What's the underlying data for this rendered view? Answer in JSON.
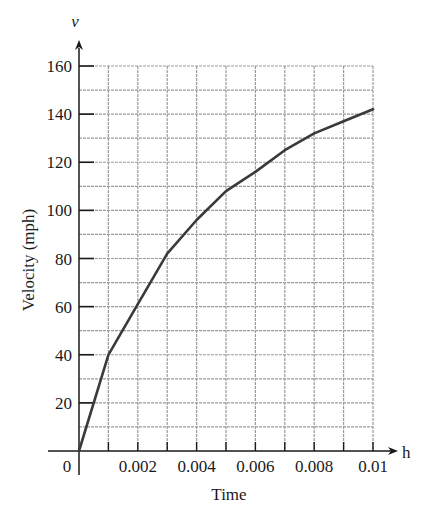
{
  "chart_data": {
    "type": "line",
    "title": "",
    "xlabel": "Time",
    "ylabel": "Velocity (mph)",
    "x_axis_variable": "h",
    "y_axis_variable": "v",
    "x": [
      0,
      0.001,
      0.002,
      0.003,
      0.004,
      0.005,
      0.006,
      0.007,
      0.008,
      0.009,
      0.01
    ],
    "series": [
      {
        "name": "Velocity",
        "values": [
          0,
          40,
          61,
          82,
          96,
          108,
          116,
          125,
          132,
          137,
          142
        ]
      }
    ],
    "xlim": [
      0,
      0.01
    ],
    "ylim": [
      0,
      160
    ],
    "x_ticks": [
      0.002,
      0.004,
      0.006,
      0.008,
      0.01
    ],
    "x_tick_labels": [
      "0.002",
      "0.004",
      "0.006",
      "0.008",
      "0.01"
    ],
    "y_ticks": [
      20,
      40,
      60,
      80,
      100,
      120,
      140,
      160
    ],
    "y_tick_labels": [
      "20",
      "40",
      "60",
      "80",
      "100",
      "120",
      "140",
      "160"
    ],
    "origin_label": "0",
    "grid": true,
    "x_grid_step": 0.001,
    "y_grid_step": 10,
    "legend": "none",
    "colors": {
      "line": "#3a3a3a",
      "grid": "#9a9a9a",
      "axis": "#1a1a1a"
    }
  }
}
